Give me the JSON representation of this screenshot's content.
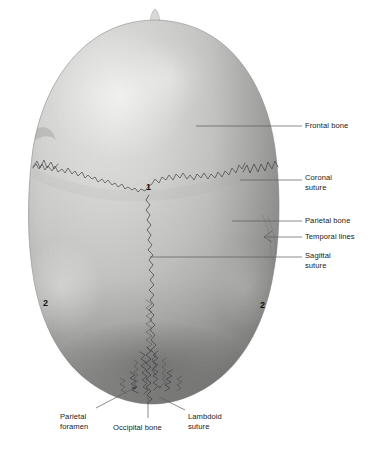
{
  "figure": {
    "view": "superior (from above)",
    "orientation_note": "anterior at top, posterior at bottom"
  },
  "labels": [
    {
      "id": "frontal-bone",
      "text": "Frontal bone",
      "lines": [
        "Frontal bone"
      ],
      "x": 305,
      "y": 121,
      "align": "left",
      "leader": {
        "x1": 196,
        "y1": 126,
        "x2": 302,
        "y2": 126
      }
    },
    {
      "id": "coronal-suture",
      "text": "Coronal suture",
      "lines": [
        "Coronal",
        "suture"
      ],
      "x": 305,
      "y": 173,
      "align": "left",
      "leader": {
        "x1": 240,
        "y1": 180,
        "x2": 302,
        "y2": 180
      }
    },
    {
      "id": "parietal-bone",
      "text": "Parietal bone",
      "lines": [
        "Parietal bone"
      ],
      "x": 305,
      "y": 216,
      "align": "left",
      "leader": {
        "x1": 232,
        "y1": 221,
        "x2": 302,
        "y2": 221
      }
    },
    {
      "id": "temporal-lines",
      "text": "Temporal lines",
      "lines": [
        "Temporal lines"
      ],
      "x": 305,
      "y": 232,
      "align": "left",
      "leader": {
        "x1": 264,
        "y1": 237,
        "x2": 302,
        "y2": 237
      }
    },
    {
      "id": "sagittal-suture",
      "text": "Sagittal suture",
      "lines": [
        "Sagittal",
        "suture"
      ],
      "x": 305,
      "y": 251,
      "align": "left",
      "leader": {
        "x1": 150,
        "y1": 257,
        "x2": 302,
        "y2": 257
      }
    },
    {
      "id": "parietal-foramen",
      "text": "Parietal foramen",
      "lines": [
        "Parietal",
        "foramen"
      ],
      "x": 60,
      "y": 412,
      "align": "left",
      "leader": {
        "x1": 134,
        "y1": 388,
        "x2": 96,
        "y2": 408
      }
    },
    {
      "id": "occipital-bone",
      "text": "Occipital bone",
      "lines": [
        "Occipital bone"
      ],
      "x": 113,
      "y": 423,
      "align": "left",
      "leader": {
        "x1": 148,
        "y1": 397,
        "x2": 148,
        "y2": 418
      }
    },
    {
      "id": "lambdoid-suture",
      "text": "Lambdoid suture",
      "lines": [
        "Lambdoid",
        "suture"
      ],
      "x": 188,
      "y": 412,
      "align": "left",
      "leader": {
        "x1": 159,
        "y1": 397,
        "x2": 185,
        "y2": 410
      }
    }
  ],
  "markers": [
    {
      "id": "marker-1",
      "text": "1",
      "x": 146,
      "y": 183,
      "refers_to": "bregma (junction of coronal and sagittal sutures)"
    },
    {
      "id": "marker-2-left",
      "text": "2",
      "x": 43,
      "y": 299,
      "refers_to": "parietal tuber (tuberosity), left"
    },
    {
      "id": "marker-2-right",
      "text": "2",
      "x": 260,
      "y": 301,
      "refers_to": "parietal tuber (tuberosity), right"
    }
  ],
  "colors": {
    "background": "#ffffff",
    "leader_line": "#5a5a5a",
    "label_text": "#1a1a1a",
    "marker_text": "#111111",
    "bone_highlight": "#e8e8e6",
    "bone_midtone": "#c6c6c4",
    "bone_shadow": "#8d8d8c",
    "bone_deep_shadow": "#6f6f6e",
    "suture_line": "#4e4e50",
    "suture_dark": "#3a3a3c"
  }
}
